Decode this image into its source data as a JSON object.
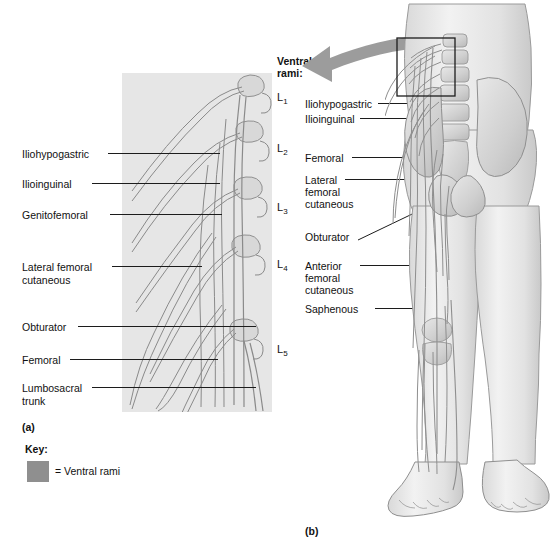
{
  "figure": {
    "panel_a_id": "(a)",
    "panel_b_id": "(b)",
    "ventral_rami_heading_line1": "Ventral",
    "ventral_rami_heading_line2": "rami:"
  },
  "colors": {
    "gray_box": "#e6e6e6",
    "key_swatch": "#8f8f8f",
    "arrow": "#9a9a9a",
    "leader_line": "#1c1c1c",
    "skin": "#e9e9e9",
    "bone": "#dcdcdc",
    "nerve": "#a8a8a8"
  },
  "panel_a": {
    "labels": [
      {
        "text": "Iliohypogastric",
        "x": 22,
        "y": 149
      },
      {
        "text": "Ilioinguinal",
        "x": 22,
        "y": 179
      },
      {
        "text": "Genitofemoral",
        "x": 22,
        "y": 210
      },
      {
        "text": "Lateral femoral",
        "x": 22,
        "y": 262
      },
      {
        "text": "cutaneous",
        "x": 22,
        "y": 274
      },
      {
        "text": "Obturator",
        "x": 22,
        "y": 322
      },
      {
        "text": "Femoral",
        "x": 22,
        "y": 355
      },
      {
        "text": "Lumbosacral",
        "x": 22,
        "y": 383
      },
      {
        "text": "trunk",
        "x": 22,
        "y": 395
      }
    ],
    "vertebrae": [
      {
        "label": "L",
        "sub": "1",
        "x": 277,
        "y": 91
      },
      {
        "label": "L",
        "sub": "2",
        "x": 277,
        "y": 142
      },
      {
        "label": "L",
        "sub": "3",
        "x": 277,
        "y": 201
      },
      {
        "label": "L",
        "sub": "4",
        "x": 277,
        "y": 258
      },
      {
        "label": "L",
        "sub": "5",
        "x": 277,
        "y": 343
      }
    ]
  },
  "panel_b": {
    "labels": [
      {
        "text": "Iliohypogastric",
        "x": 305,
        "y": 99
      },
      {
        "text": "Ilioinguinal",
        "x": 305,
        "y": 114
      },
      {
        "text": "Femoral",
        "x": 305,
        "y": 153
      },
      {
        "text": "Lateral",
        "x": 305,
        "y": 175
      },
      {
        "text": "femoral",
        "x": 305,
        "y": 187
      },
      {
        "text": "cutaneous",
        "x": 305,
        "y": 199
      },
      {
        "text": "Obturator",
        "x": 305,
        "y": 232
      },
      {
        "text": "Anterior",
        "x": 305,
        "y": 261
      },
      {
        "text": "femoral",
        "x": 305,
        "y": 273
      },
      {
        "text": "cutaneous",
        "x": 305,
        "y": 285
      },
      {
        "text": "Saphenous",
        "x": 305,
        "y": 304
      }
    ]
  },
  "key": {
    "title": "Key:",
    "entry": "= Ventral rami"
  }
}
